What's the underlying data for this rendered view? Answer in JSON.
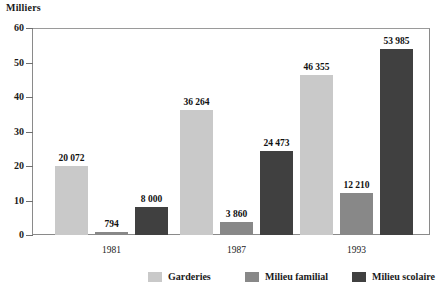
{
  "chart_data": {
    "type": "bar",
    "title": "",
    "subtitle": "",
    "unit_label": "Milliers",
    "xlabel": "",
    "ylabel": "Milliers",
    "categories": [
      "1981",
      "1987",
      "1993"
    ],
    "series": [
      {
        "name": "Garderies",
        "color": "#c9c9c9",
        "values": [
          20072,
          3860,
          46355
        ],
        "value_labels": [
          "20 072",
          "3 860",
          "46 355"
        ]
      },
      {
        "name": "Milieu familial",
        "color": "#888888",
        "values": [
          794,
          24473,
          12210
        ],
        "value_labels": [
          "794",
          "24 473",
          "12 210"
        ]
      },
      {
        "name": "Milieu scolaire",
        "color": "#404040",
        "values": [
          8000,
          36264,
          53985
        ],
        "value_labels": [
          "8 000",
          "36 264",
          "53 985"
        ]
      }
    ],
    "plotted_series_order_per_group": [
      [
        "Garderies",
        "Milieu familial",
        "Milieu scolaire"
      ],
      [
        "Garderies",
        "Milieu familial",
        "Milieu scolaire"
      ],
      [
        "Garderies",
        "Milieu familial",
        "Milieu scolaire"
      ]
    ],
    "bars": [
      {
        "group": "1981",
        "series": "Garderies",
        "value": 20072,
        "label": "20 072",
        "style": "s0"
      },
      {
        "group": "1981",
        "series": "Milieu familial",
        "value": 794,
        "label": "794",
        "style": "s1"
      },
      {
        "group": "1981",
        "series": "Milieu scolaire",
        "value": 8000,
        "label": "8 000",
        "style": "s2"
      },
      {
        "group": "1987",
        "series": "Garderies",
        "value": 36264,
        "label": "36 264",
        "style": "s0"
      },
      {
        "group": "1987",
        "series": "Milieu familial",
        "value": 3860,
        "label": "3 860",
        "style": "s1"
      },
      {
        "group": "1987",
        "series": "Milieu scolaire",
        "value": 24473,
        "label": "24 473",
        "style": "s2"
      },
      {
        "group": "1993",
        "series": "Garderies",
        "value": 46355,
        "label": "46 355",
        "style": "s0"
      },
      {
        "group": "1993",
        "series": "Milieu familial",
        "value": 12210,
        "label": "12 210",
        "style": "s1"
      },
      {
        "group": "1993",
        "series": "Milieu scolaire",
        "value": 53985,
        "label": "53 985",
        "style": "s2"
      }
    ],
    "yticks": [
      0,
      10,
      20,
      30,
      40,
      50,
      60
    ],
    "ytick_labels": [
      "0",
      "10",
      "20",
      "30",
      "40",
      "50",
      "60"
    ],
    "ylim": [
      0,
      60
    ],
    "y_value_scale": "thousands",
    "grid": false,
    "legend_position": "bottom",
    "legend": [
      "Garderies",
      "Milieu familial",
      "Milieu scolaire"
    ]
  },
  "legend": {
    "items": [
      {
        "label": "Garderies",
        "style": "s0"
      },
      {
        "label": "Milieu familial",
        "style": "s1"
      },
      {
        "label": "Milieu scolaire",
        "style": "s2"
      }
    ]
  }
}
